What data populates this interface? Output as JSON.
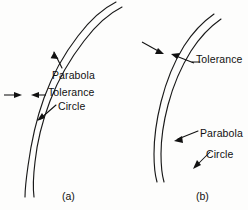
{
  "figure": {
    "type": "technical-line-drawing",
    "background_color": "#fdfdfc",
    "line_color": "#1a1a1a",
    "text_color": "#111111"
  },
  "panels": [
    {
      "id": "a",
      "caption": "(a)",
      "caption_x": 62,
      "caption_y": 190,
      "labels": [
        {
          "name": "parabola",
          "text": "Parabola",
          "x": 52,
          "y": 70
        },
        {
          "name": "tolerance",
          "text": "Tolerance",
          "x": 48,
          "y": 87
        },
        {
          "name": "circle",
          "text": "Circle",
          "x": 58,
          "y": 101
        }
      ],
      "curves": [
        {
          "name": "parabola-curve",
          "kind": "parabola",
          "path": "M 113 4 C 96 14 74 38 58 66 C 44 92 34 124 30 160 C 28 178 27 190 27 196"
        },
        {
          "name": "circle-curve",
          "kind": "circle",
          "path": "M 119 10 C 100 20 78 44 62 72 C 48 98 40 126 37 152 C 35 172 35 186 36 196"
        }
      ]
    },
    {
      "id": "b",
      "caption": "(b)",
      "caption_x": 196,
      "caption_y": 190,
      "labels": [
        {
          "name": "tolerance",
          "text": "Tolerance",
          "x": 196,
          "y": 54
        },
        {
          "name": "parabola",
          "text": "Parabola",
          "x": 200,
          "y": 128
        },
        {
          "name": "circle",
          "text": "Circle",
          "x": 206,
          "y": 149
        }
      ],
      "curves": [
        {
          "name": "parabola-curve",
          "kind": "parabola",
          "path": "M 212 16 C 200 26 186 44 176 66 C 166 90 160 116 158 140 C 157 158 158 170 160 178"
        },
        {
          "name": "circle-curve",
          "kind": "circle",
          "path": "M 218 22 C 204 32 190 50 180 72 C 170 96 165 120 164 142 C 163 160 164 172 166 180"
        }
      ]
    }
  ],
  "annotations": {
    "tolerance_band_a": {
      "name": "tolerance-band-arrows-a",
      "description": "Two opposing arrows spanning the gap between the two curves"
    },
    "tolerance_band_b": {
      "name": "tolerance-band-arrows-b",
      "description": "Two opposing arrows converging on the narrow band between the two curves"
    }
  }
}
